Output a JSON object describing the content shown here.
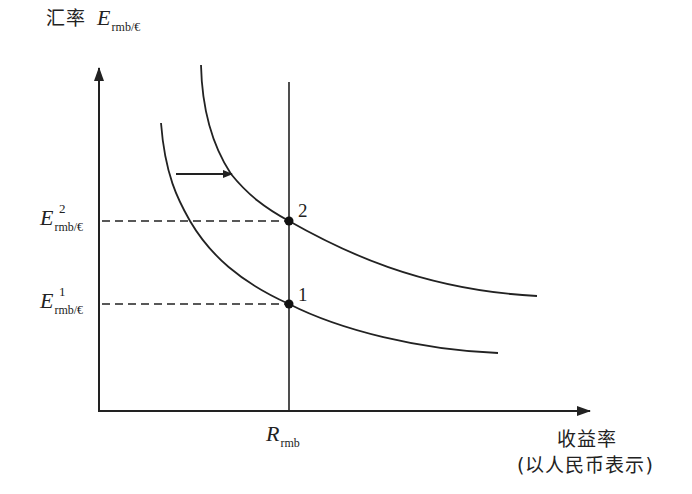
{
  "diagram": {
    "y_axis": {
      "label_cn": "汇率",
      "label_symbol": "E",
      "label_subscript": "rmb/€"
    },
    "x_axis": {
      "label_line1": "收益率",
      "label_line2": "(以人民币表示)"
    },
    "x_marker": {
      "symbol": "R",
      "subscript": "rmb"
    },
    "y_markers": [
      {
        "symbol": "E",
        "superscript": "2",
        "subscript": "rmb/€"
      },
      {
        "symbol": "E",
        "superscript": "1",
        "subscript": "rmb/€"
      }
    ],
    "points": [
      {
        "label": "1"
      },
      {
        "label": "2"
      }
    ],
    "curves": [
      {
        "name": "initial-demand-curve"
      },
      {
        "name": "shifted-demand-curve"
      }
    ],
    "shift_arrow": {
      "direction": "right"
    },
    "colors": {
      "line": "#222222",
      "background": "#ffffff"
    }
  }
}
